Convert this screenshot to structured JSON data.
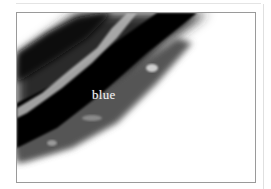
{
  "image": {
    "caption": "blue",
    "colors": {
      "frame": "#9a9a9a",
      "background": "#ffffff",
      "dark": "#050505",
      "mid": "#5a5a5a"
    }
  }
}
